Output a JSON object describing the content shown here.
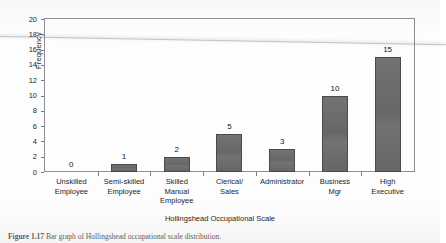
{
  "chart_data": {
    "type": "bar",
    "title": "",
    "xlabel": "Hollingshead Occupational Scale",
    "ylabel": "Frequency",
    "categories": [
      "Unskilled Employee",
      "Semi-skilled Employee",
      "Skilled Manual Employee",
      "Clerical/ Sales",
      "Administrator",
      "Business Mgr",
      "High Executive"
    ],
    "category_lines": [
      [
        "Unskilled",
        "Employee"
      ],
      [
        "Semi-skilled",
        "Employee"
      ],
      [
        "Skilled",
        "Manual",
        "Employee"
      ],
      [
        "Clerical/",
        "Sales"
      ],
      [
        "Administrator"
      ],
      [
        "Business",
        "Mgr"
      ],
      [
        "High",
        "Executive"
      ]
    ],
    "values": [
      0,
      1,
      2,
      5,
      3,
      10,
      15
    ],
    "value_labels": [
      "0",
      "1",
      "2",
      "5",
      "3",
      "10",
      "15"
    ],
    "ylim": [
      0,
      20
    ],
    "yticks": [
      0,
      2,
      4,
      6,
      8,
      10,
      12,
      14,
      16,
      18,
      20
    ],
    "ytick_labels": [
      "0",
      "2",
      "4",
      "6",
      "8",
      "10",
      "12",
      "14",
      "16",
      "18",
      "20"
    ],
    "grid": false,
    "legend": false,
    "bar_color": "#6b6b6b",
    "bar_edge_color": "#4a4a4a",
    "frame_color": "#8e8e92"
  },
  "caption": {
    "label": "Figure 1.17",
    "text": "Bar graph of Hollingshead occupational scale distribution."
  }
}
